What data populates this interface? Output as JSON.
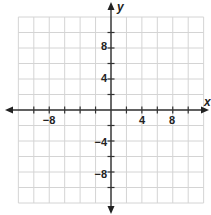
{
  "chart_data": {
    "type": "coordinate-grid",
    "title": "",
    "xlabel": "x",
    "ylabel": "y",
    "xlim": [
      -12,
      12
    ],
    "ylim": [
      -12,
      12
    ],
    "grid": true,
    "grid_step": 2,
    "x_tick_step": 2,
    "y_tick_step": 2,
    "x_tick_labels": [
      {
        "value": -8,
        "label": "−8"
      },
      {
        "value": 4,
        "label": "4"
      },
      {
        "value": 8,
        "label": "8"
      }
    ],
    "y_tick_labels": [
      {
        "value": 8,
        "label": "8"
      },
      {
        "value": 4,
        "label": "4"
      },
      {
        "value": -4,
        "label": "−4"
      },
      {
        "value": -8,
        "label": "−8"
      }
    ],
    "series": []
  },
  "colors": {
    "grid": "#d4d4d4",
    "axis": "#333333",
    "background": "#ffffff"
  },
  "labels": {
    "x_axis": "x",
    "y_axis": "y",
    "x_neg8": "−8",
    "x_4": "4",
    "x_8": "8",
    "y_8": "8",
    "y_4": "4",
    "y_neg4": "−4",
    "y_neg8": "−8"
  }
}
